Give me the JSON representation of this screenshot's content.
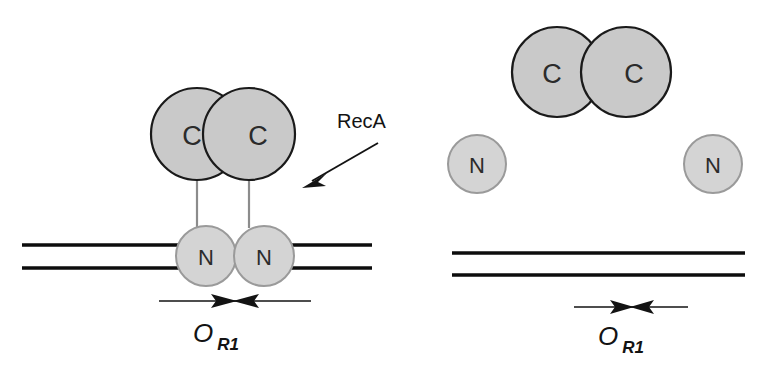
{
  "figure": {
    "background_color": "#ffffff"
  },
  "colors": {
    "c_domain_fill": "#c9c9c9",
    "c_domain_stroke": "#1a1a1a",
    "n_domain_fill": "#d4d4d4",
    "n_domain_stroke": "#9a9a9a",
    "dna_stroke": "#0d0d0d",
    "linker_stroke": "#8c8c8c",
    "text_color": "#131313"
  },
  "annotations": {
    "reca_label": "RecA"
  },
  "panels": {
    "left": {
      "name": "repressor-bound-dna",
      "c_domains": [
        {
          "label": "C",
          "cx": 197,
          "cy": 134,
          "r": 46
        },
        {
          "label": "C",
          "cx": 249,
          "cy": 134,
          "r": 46
        }
      ],
      "n_domains": [
        {
          "label": "N",
          "cx": 206,
          "cy": 256,
          "r": 30
        },
        {
          "label": "N",
          "cx": 264,
          "cy": 256,
          "r": 30
        }
      ],
      "linkers": [
        {
          "x": 197,
          "y1": 180,
          "y2": 226
        },
        {
          "x": 249,
          "y1": 180,
          "y2": 226
        }
      ],
      "dna_segments": [
        {
          "x1": 22,
          "x2": 189,
          "y": 245
        },
        {
          "x1": 22,
          "x2": 189,
          "y": 268
        },
        {
          "x1": 282,
          "x2": 372,
          "y": 245
        },
        {
          "x1": 282,
          "x2": 268,
          "y": 268
        },
        {
          "x1": 282,
          "x2": 372,
          "y": 268
        }
      ],
      "operator_marker": {
        "x1": 159,
        "x2": 311,
        "y": 301,
        "center": 235
      },
      "operator_label": {
        "main": "O",
        "subscript": "R1",
        "x": 210,
        "y": 342
      }
    },
    "right": {
      "name": "cleaved-repressor-free-dna",
      "c_domains": [
        {
          "label": "C",
          "cx": 557,
          "cy": 72,
          "r": 45
        },
        {
          "label": "C",
          "cx": 626,
          "cy": 72,
          "r": 45
        }
      ],
      "n_domains": [
        {
          "label": "N",
          "cx": 477,
          "cy": 164,
          "r": 29
        },
        {
          "label": "N",
          "cx": 713,
          "cy": 164,
          "r": 29
        }
      ],
      "linkers": [],
      "dna_segments": [
        {
          "x1": 452,
          "x2": 745,
          "y": 253
        },
        {
          "x1": 452,
          "x2": 745,
          "y": 275
        }
      ],
      "operator_marker": {
        "x1": 574,
        "x2": 688,
        "y": 307,
        "center": 632
      },
      "operator_label": {
        "main": "O",
        "subscript": "R1",
        "x": 615,
        "y": 345
      }
    }
  },
  "reca_arrow": {
    "x1": 378,
    "y1": 143,
    "x2": 305,
    "y2": 186,
    "label_x": 337,
    "label_y": 128
  }
}
